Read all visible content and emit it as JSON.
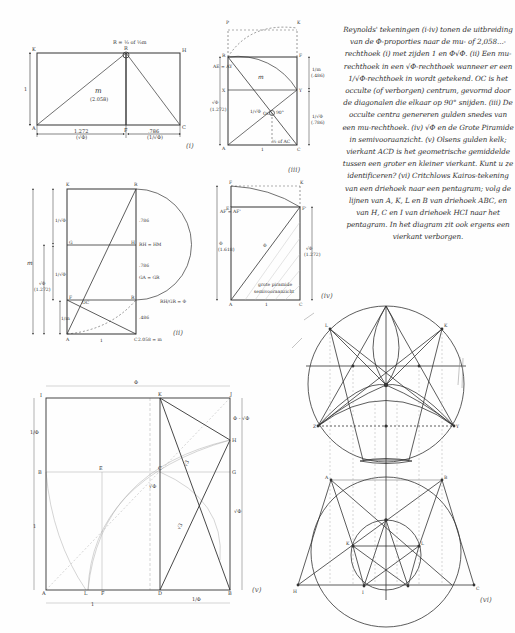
{
  "caption": "Reynolds' tekeningen (i-iv) tonen de uitbreiding van de Φ-proporties naar de mu- of 2,058...-rechthoek (i) met zijden 1 en Φ√Φ. (ii) Een mu-rechthoek in een √Φ-rechthoek wanneer er een 1/√Φ-rechthoek in wordt getekend. OC is het occulte (of verborgen) centrum, gevormd door de diagonalen die elkaar op 90° snijden. (iii) De occulte centra genereren gulden snedes van een mu-rechthoek. (iv) √Φ en de Grote Piramide in semivooraanzicht. (v) Olsens gulden kelk; vierkant ACD is het geometrische gemiddelde tussen een groter en kleiner vierkant. Kunt u ze identificeren? (vi) Critchlows Kairos-tekening van een driehoek naar een pentagram; volg de lijnen van A, K, L en B van driehoek ABC, en van H, C en I van driehoek HCI naar het pentagram. In het diagram zit ook ergens een vierkant verborgen.",
  "figures": {
    "i": {
      "numeral": "(i)",
      "top_note": "R = ½ of ½m",
      "points": [
        "K",
        "R",
        "H",
        "A",
        "F",
        "C"
      ],
      "center_label": "m",
      "center_value": "(2.058)",
      "side_label": "1",
      "bottom_left": "1.272",
      "bottom_left_sub": "(√Φ)",
      "bottom_right": ".786",
      "bottom_right_sub": "(1/√Φ)"
    },
    "ii": {
      "numeral": "(ii)",
      "points": [
        "K",
        "R",
        "G",
        "H",
        "F",
        "A",
        "C"
      ],
      "left_m": "m",
      "left_half_phi": "1/√Φ",
      "left_sqrt_phi": "√Φ",
      "left_sqrt_val": "(1.272)",
      "left_small": "1/m",
      "right_786a": ".786",
      "right_eq1": "RH = HM",
      "right_786b": ".786",
      "right_eq2": "GA = GR",
      "right_ratio": "RH/GR = Φ",
      "right_486": ".486",
      "bottom_1": "1",
      "bottom_right": "2.058 = m",
      "oc": "OC"
    },
    "iii": {
      "numeral": "(iii)",
      "points": [
        "P",
        "K",
        "R",
        "F",
        "X",
        "Y",
        "A",
        "C"
      ],
      "left_note": "AE = AY",
      "left_sqrt": "√Φ",
      "left_val": "(1.272)",
      "m": "m",
      "inner_frac": "1/√Φ",
      "oc": "OC",
      "angle": "90°",
      "right_top": "1/m",
      "right_top_val": "(.486)",
      "right_bot": "1/√Φ",
      "right_bot_val": "(.786)",
      "bottom": "1",
      "bottom_note": "½ of AC"
    },
    "iv": {
      "numeral": "(iv)",
      "points": [
        "F",
        "K",
        "E",
        "F'",
        "A",
        "C"
      ],
      "left_note": "AF = AF'",
      "left_phi": "Φ",
      "left_val": "(1.618)",
      "diag": "Φ",
      "right_sqrt": "√Φ",
      "right_val": "(1.272)",
      "bottom": "1",
      "pyramid_label_1": "grote piramide",
      "pyramid_label_2": "semivooraanzicht"
    },
    "v": {
      "numeral": "(v)",
      "top": "Φ",
      "points": [
        "I",
        "K",
        "J",
        "H",
        "B",
        "E",
        "C",
        "G",
        "A",
        "L",
        "F",
        "D",
        "B2"
      ],
      "left_top": "1/Φ",
      "left_mid": "1",
      "right_top": "Φ - √Φ",
      "right_bot": "√Φ",
      "mid_v": "√Φ",
      "diag1": "√3",
      "diag2": "√3",
      "bottom_1": "1",
      "bottom_right": "1/Φ"
    },
    "vi": {
      "numeral": "(vi)",
      "points": [
        "A",
        "K",
        "L",
        "B",
        "H",
        "C",
        "I"
      ]
    }
  }
}
